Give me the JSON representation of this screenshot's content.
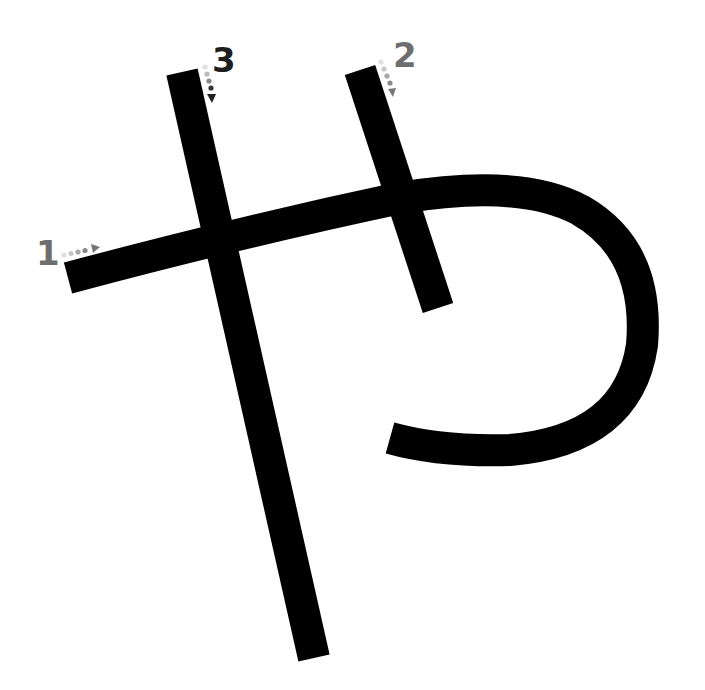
{
  "diagram": {
    "type": "stroke-order",
    "background": "#ffffff",
    "stroke_color": "#000000",
    "stroke_width": 32,
    "strokes": [
      {
        "order": 1,
        "label": "1",
        "label_color": "#6e6e6e",
        "direction": "left-to-right",
        "path": "M 68 278 Q 240 232 400 198 Q 520 178 580 210 Q 650 250 642 345 Q 628 440 510 450 Q 440 452 390 438"
      },
      {
        "order": 2,
        "label": "2",
        "label_color": "#6e6e6e",
        "direction": "top-to-bottom",
        "path": "M 360 70 L 438 308"
      },
      {
        "order": 3,
        "label": "3",
        "label_color": "#1e1e1e",
        "direction": "top-to-bottom",
        "path": "M 182 72 L 314 658"
      }
    ]
  }
}
